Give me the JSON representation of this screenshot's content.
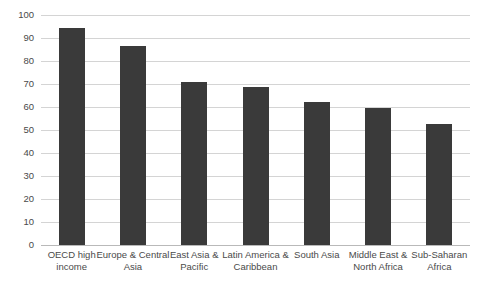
{
  "chart_data": {
    "type": "bar",
    "title": "",
    "subtitle": "",
    "xlabel": "",
    "ylabel": "",
    "ylim": [
      0,
      100
    ],
    "y_ticks": [
      0,
      10,
      20,
      30,
      40,
      50,
      60,
      70,
      80,
      90,
      100
    ],
    "grid": true,
    "legend": "none",
    "bar_color": "#3a3a3a",
    "gridline_color": "#d4d4d4",
    "background_color": "#ffffff",
    "categories": [
      "OECD high income",
      "Europe & Central Asia",
      "East Asia & Pacific",
      "Latin America & Caribbean",
      "South Asia",
      "Middle East & North Africa",
      "Sub-Saharan Africa"
    ],
    "values": [
      94.5,
      86.5,
      71,
      68.5,
      62,
      59.5,
      52.5
    ]
  }
}
